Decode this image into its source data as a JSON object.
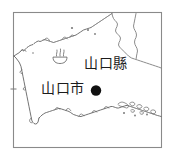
{
  "figure": {
    "kind": "line-map",
    "region_name": "山口縣",
    "background_color": "#ffffff",
    "frame_color": "#8a8a8a",
    "line_color": "#5a5a5a",
    "marker_color": "#111111"
  },
  "labels": {
    "prefecture": "山口縣",
    "city": "山口市"
  },
  "markers": {
    "city_dot": {
      "name": "山口市",
      "symbol": "filled-circle"
    },
    "hot_spring": {
      "symbol": "onsen"
    }
  }
}
